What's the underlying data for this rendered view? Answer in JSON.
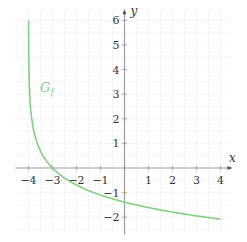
{
  "chart_data": {
    "type": "line",
    "title": "",
    "xlabel": "x",
    "ylabel": "y",
    "xlim": [
      -4.55,
      4.5
    ],
    "ylim": [
      -2.7,
      6.5
    ],
    "xticks": [
      -4,
      -3,
      -2,
      -1,
      1,
      2,
      3,
      4
    ],
    "yticks": [
      -2,
      -1,
      1,
      2,
      3,
      4,
      5,
      6
    ],
    "xtick_labels": [
      "−4",
      "−3",
      "−2",
      "−1",
      "1",
      "2",
      "3",
      "4"
    ],
    "ytick_labels": [
      "−2",
      "−1",
      "1",
      "2",
      "3",
      "4",
      "5",
      "6"
    ],
    "grid": true,
    "grid_style": "dashed",
    "series": [
      {
        "name": "G_f",
        "label_main": "G",
        "label_sub": "f",
        "function": "-ln(x+4)",
        "color": "#7fd07f",
        "x": [
          -3.9975,
          -3.99,
          -3.95,
          -3.9,
          -3.8,
          -3.7,
          -3.6,
          -3.5,
          -3.25,
          -3.0,
          -2.5,
          -2.0,
          -1.5,
          -1.0,
          0.0,
          1.0,
          2.0,
          3.0,
          4.0
        ],
        "y": [
          6.0,
          4.61,
          3.0,
          2.3,
          1.61,
          1.2,
          0.92,
          0.69,
          0.29,
          0.0,
          -0.41,
          -0.69,
          -0.92,
          -1.1,
          -1.39,
          -1.61,
          -1.79,
          -1.95,
          -2.08
        ]
      }
    ],
    "annotations": [
      {
        "text": "G_f",
        "x": -3.3,
        "y": 3.2
      }
    ]
  },
  "labels": {
    "x_axis": "x",
    "y_axis": "y",
    "curve_main": "G",
    "curve_sub": "f"
  },
  "colors": {
    "curve": "#7fd07f",
    "axis": "#9a9a9a",
    "grid": "#e4e4e4",
    "text": "#333333"
  }
}
